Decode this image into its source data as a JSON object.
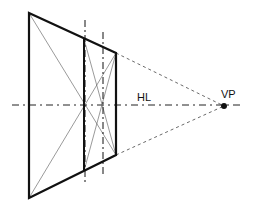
{
  "diagram": {
    "labels": {
      "horizon_line": "HL",
      "vanishing_point": "VP"
    },
    "colors": {
      "stroke": "#111111",
      "thin": "#555555",
      "background": "#ffffff"
    }
  }
}
